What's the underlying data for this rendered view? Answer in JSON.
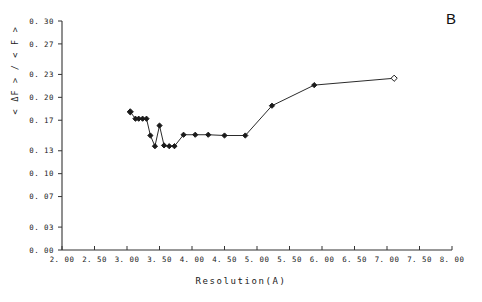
{
  "panel": {
    "label": "B"
  },
  "chart_data": {
    "type": "line",
    "title": "",
    "subtitle": "",
    "panel_label": "B",
    "xlabel": "Resolution(A)",
    "ylabel": "< ΔF > / < F >",
    "xlim": [
      2.0,
      8.0
    ],
    "ylim": [
      0.0,
      0.3
    ],
    "xticks": [
      2.0,
      2.5,
      3.0,
      3.5,
      4.0,
      4.5,
      5.0,
      5.5,
      6.0,
      6.5,
      7.0,
      7.5,
      8.0
    ],
    "xtick_labels": [
      "2. 00",
      "2. 50",
      "3. 00",
      "3. 50",
      "4. 00",
      "4. 50",
      "5. 00",
      "5. 50",
      "6. 00",
      "6. 50",
      "7. 00",
      "7. 50",
      "8. 00"
    ],
    "yticks": [
      0.0,
      0.03,
      0.07,
      0.1,
      0.13,
      0.17,
      0.2,
      0.23,
      0.27,
      0.3
    ],
    "ytick_labels": [
      "0. 00",
      "0. 03",
      "0. 07",
      "0. 10",
      "0. 13",
      "0. 17",
      "0. 20",
      "0. 23",
      "0. 27",
      "0. 30"
    ],
    "grid": false,
    "legend": null,
    "marker": "diamond",
    "line_color": "#2b2b2b",
    "marker_color": "#1a1a1a",
    "series": [
      {
        "name": "dF/F vs resolution",
        "x": [
          3.05,
          3.13,
          3.18,
          3.24,
          3.3,
          3.36,
          3.43,
          3.5,
          3.57,
          3.65,
          3.73,
          3.87,
          4.05,
          4.25,
          4.5,
          4.82,
          5.23,
          5.88,
          7.11
        ],
        "y": [
          0.181,
          0.172,
          0.172,
          0.172,
          0.172,
          0.15,
          0.136,
          0.163,
          0.137,
          0.136,
          0.136,
          0.151,
          0.151,
          0.151,
          0.15,
          0.15,
          0.189,
          0.216,
          0.225
        ]
      }
    ]
  },
  "axes": {
    "x_axis_name": "resolution-axis",
    "y_axis_name": "amplitude-ratio-axis"
  }
}
